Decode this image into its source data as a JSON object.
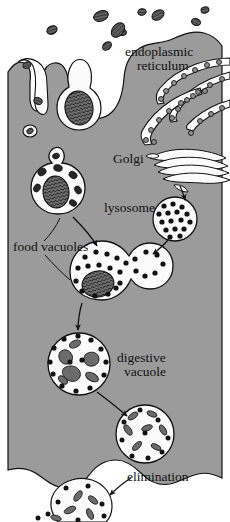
{
  "figure": {
    "name": "phagocytosis-intracellular-digestion-diagram",
    "width": 230,
    "height": 522,
    "background_color": "#ffffff",
    "cytoplasm_color": "#9b9b9b",
    "organelle_fill": "#fbfbfb",
    "ink_color": "#111111",
    "particle_color": "#3a3a3a"
  },
  "labels": {
    "endoplasmic_reticulum_line1": "endoplasmic",
    "endoplasmic_reticulum_line2": "reticulum",
    "golgi": "Golgi",
    "lysosome": "lysosome",
    "food_vacuoles": "food  vacuoles",
    "digestive_vacuole_line1": "digestive",
    "digestive_vacuole_line2": "vacuole",
    "elimination": "elimination"
  },
  "structures": [
    {
      "id": "extracellular-food-particles",
      "label": "food particles outside cell",
      "count": 9
    },
    {
      "id": "cell-membrane",
      "label": "cell membrane"
    },
    {
      "id": "membrane-invagination",
      "label": "membrane invagination"
    },
    {
      "id": "phagocytic-vesicle",
      "label": "phagocytic vesicle forming"
    },
    {
      "id": "rough-endoplasmic-reticulum",
      "label": "rough endoplasmic reticulum"
    },
    {
      "id": "golgi-apparatus",
      "label": "Golgi apparatus"
    },
    {
      "id": "lysosome-vesicle",
      "label": "lysosome"
    },
    {
      "id": "food-vacuole",
      "label": "food vacuole"
    },
    {
      "id": "fusing-vacuole",
      "label": "lysosome fusing with food vacuole"
    },
    {
      "id": "digestive-vacuole",
      "label": "digestive vacuole"
    },
    {
      "id": "residual-vacuole",
      "label": "residual vacuole"
    },
    {
      "id": "elimination-bulge",
      "label": "elimination of undigested residue"
    }
  ],
  "arrows": [
    {
      "id": "arrow-golgi-to-lysosome",
      "from": "golgi-apparatus",
      "to": "lysosome-vesicle"
    },
    {
      "id": "arrow-lysosome-to-fusing",
      "from": "lysosome-vesicle",
      "to": "fusing-vacuole"
    },
    {
      "id": "arrow-foodvacuole-to-fusing",
      "from": "food-vacuole",
      "to": "fusing-vacuole"
    },
    {
      "id": "arrow-fusing-to-digestive",
      "from": "fusing-vacuole",
      "to": "digestive-vacuole"
    },
    {
      "id": "arrow-digestive-to-residual",
      "from": "digestive-vacuole",
      "to": "residual-vacuole"
    },
    {
      "id": "arrow-elimination",
      "from": "elimination-label",
      "to": "elimination-bulge"
    }
  ]
}
